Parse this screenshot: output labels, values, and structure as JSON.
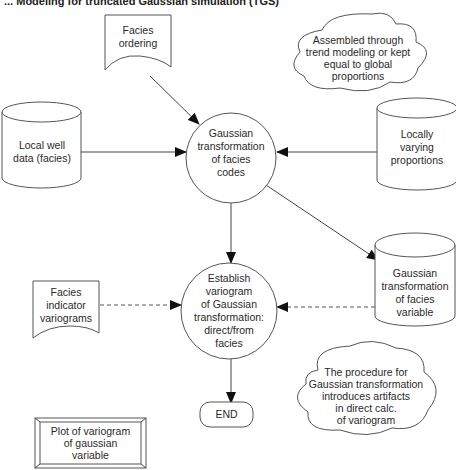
{
  "title": "... Modeling for truncated Gaussian simulation (TGS)",
  "nodes": {
    "facies_ordering": {
      "type": "document",
      "lines": [
        "Facies",
        "ordering"
      ]
    },
    "trend_note": {
      "type": "cloud",
      "lines": [
        "Assembled through",
        "trend modeling or kept",
        "equal to global",
        "proportions"
      ]
    },
    "local_well_data": {
      "type": "database",
      "lines": [
        "Local well",
        "data (facies)"
      ]
    },
    "gaussian_transform_codes": {
      "type": "process",
      "lines": [
        "Gaussian",
        "transformation",
        "of facies",
        "codes"
      ]
    },
    "locally_varying_proportions": {
      "type": "database",
      "lines": [
        "Locally",
        "varying",
        "proportions"
      ]
    },
    "facies_indicator_variograms": {
      "type": "document",
      "lines": [
        "Facies",
        "indicator",
        "variograms"
      ]
    },
    "establish_variogram": {
      "type": "process",
      "lines": [
        "Establish",
        "variogram",
        "of Gaussian",
        "transformation:",
        "direct/from",
        "facies"
      ]
    },
    "gaussian_transform_variable": {
      "type": "database",
      "lines": [
        "Gaussian",
        "transformation",
        "of facies",
        "variable"
      ]
    },
    "artifacts_note": {
      "type": "cloud",
      "lines": [
        "The procedure for",
        "Gaussian transformation",
        "introduces artifacts",
        "in direct calc.",
        "of variogram"
      ]
    },
    "end": {
      "type": "terminator",
      "lines": [
        "END"
      ]
    },
    "plot_variogram": {
      "type": "display",
      "lines": [
        "Plot of variogram",
        "of gaussian",
        "variable"
      ]
    }
  },
  "edges": [
    {
      "from": "facies_ordering",
      "to": "gaussian_transform_codes",
      "style": "solid"
    },
    {
      "from": "local_well_data",
      "to": "gaussian_transform_codes",
      "style": "solid"
    },
    {
      "from": "locally_varying_proportions",
      "to": "gaussian_transform_codes",
      "style": "solid"
    },
    {
      "from": "gaussian_transform_codes",
      "to": "establish_variogram",
      "style": "solid"
    },
    {
      "from": "gaussian_transform_codes",
      "to": "gaussian_transform_variable",
      "style": "solid"
    },
    {
      "from": "facies_indicator_variograms",
      "to": "establish_variogram",
      "style": "dashed"
    },
    {
      "from": "gaussian_transform_variable",
      "to": "establish_variogram",
      "style": "dashed"
    },
    {
      "from": "establish_variogram",
      "to": "end",
      "style": "solid"
    }
  ],
  "colors": {
    "stroke": "#555555",
    "text": "#2a2a2a",
    "background": "#ffffff"
  }
}
